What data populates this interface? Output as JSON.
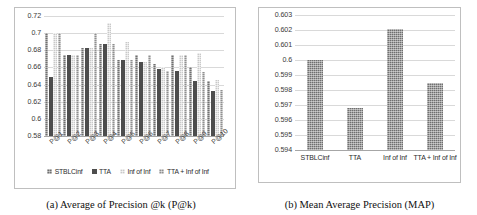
{
  "figure": {
    "panel_a": {
      "caption": "(a) Average of Precision @k (P@k)",
      "legend": [
        {
          "label": "STBLCinf",
          "color": "#6f6f6f"
        },
        {
          "label": "TTA",
          "color": "#4d4d4d"
        },
        {
          "label": "Inf of Inf",
          "color": "#c9c9c9"
        },
        {
          "label": "TTA + Inf of Inf",
          "color": "#8f8f8f"
        }
      ]
    },
    "panel_b": {
      "caption": "(b) Mean Average Precision (MAP)"
    }
  },
  "chart_data": [
    {
      "type": "bar",
      "title": "(a) Average of Precision @k (P@k)",
      "xlabel": "",
      "ylabel": "",
      "ylim": [
        0.58,
        0.72
      ],
      "yticks": [
        "0.58",
        "0.6",
        "0.62",
        "0.64",
        "0.66",
        "0.68",
        "0.7",
        "0.72"
      ],
      "grid": true,
      "legend_position": "bottom",
      "categories": [
        "P@1",
        "P@2",
        "P@3",
        "P@4",
        "P@5",
        "P@6",
        "P@7",
        "P@8",
        "P@9",
        "P@10"
      ],
      "series": [
        {
          "name": "STBLCinf",
          "values": [
            0.7,
            0.675,
            0.683,
            0.687,
            0.669,
            0.675,
            0.664,
            0.675,
            0.661,
            0.644
          ]
        },
        {
          "name": "TTA",
          "values": [
            0.649,
            0.675,
            0.683,
            0.687,
            0.669,
            0.666,
            0.658,
            0.656,
            0.644,
            0.632
          ]
        },
        {
          "name": "Inf of Inf",
          "values": [
            0.7,
            0.675,
            0.683,
            0.712,
            0.69,
            0.666,
            0.66,
            0.675,
            0.677,
            0.645
          ]
        },
        {
          "name": "TTA + Inf of Inf",
          "values": [
            0.7,
            0.675,
            0.7,
            0.687,
            0.669,
            0.675,
            0.656,
            0.675,
            0.655,
            0.634
          ]
        }
      ]
    },
    {
      "type": "bar",
      "title": "(b) Mean Average Precision (MAP)",
      "xlabel": "",
      "ylabel": "",
      "ylim": [
        0.594,
        0.603
      ],
      "yticks": [
        "0.594",
        "0.595",
        "0.596",
        "0.597",
        "0.598",
        "0.599",
        "0.6",
        "0.601",
        "0.602",
        "0.603"
      ],
      "grid": true,
      "legend_position": "none",
      "categories": [
        "STBLCinf",
        "TTA",
        "Inf of Inf",
        "TTA + Inf of Inf"
      ],
      "values": [
        0.6,
        0.5968,
        0.6021,
        0.5985
      ],
      "bar_color": "#6f6f6f"
    }
  ]
}
